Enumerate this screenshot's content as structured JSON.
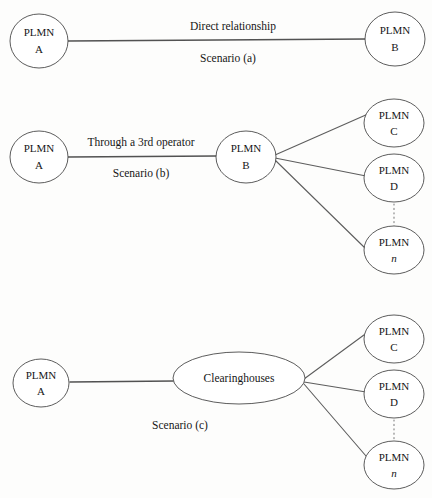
{
  "figure": {
    "background_color": "#fdfdfc",
    "stroke_color": "#5d5d5d",
    "node_fill": "#ffffff",
    "text_color": "#161616"
  },
  "scenarios": [
    {
      "id": "a",
      "caption": "Scenario (a)",
      "edge_caption": "Direct relationship",
      "nodes": [
        {
          "id": "a-plmn-a",
          "top": "PLMN",
          "bottom": "A",
          "shape": "circle",
          "italic_bottom": false
        },
        {
          "id": "a-plmn-b",
          "top": "PLMN",
          "bottom": "B",
          "shape": "circle",
          "italic_bottom": false
        }
      ]
    },
    {
      "id": "b",
      "caption": "Scenario (b)",
      "edge_caption": "Through a 3rd operator",
      "nodes": [
        {
          "id": "b-plmn-a",
          "top": "PLMN",
          "bottom": "A",
          "shape": "circle",
          "italic_bottom": false
        },
        {
          "id": "b-plmn-b",
          "top": "PLMN",
          "bottom": "B",
          "shape": "circle",
          "italic_bottom": false
        },
        {
          "id": "b-plmn-c",
          "top": "PLMN",
          "bottom": "C",
          "shape": "circle",
          "italic_bottom": false
        },
        {
          "id": "b-plmn-d",
          "top": "PLMN",
          "bottom": "D",
          "shape": "circle",
          "italic_bottom": false
        },
        {
          "id": "b-plmn-n",
          "top": "PLMN",
          "bottom": "n",
          "shape": "circle",
          "italic_bottom": true
        }
      ]
    },
    {
      "id": "c",
      "caption": "Scenario (c)",
      "edge_caption": "",
      "hub_label": "Clearinghouses",
      "nodes": [
        {
          "id": "c-plmn-a",
          "top": "PLMN",
          "bottom": "A",
          "shape": "circle",
          "italic_bottom": false
        },
        {
          "id": "c-hub",
          "top": "Clearinghouses",
          "bottom": "",
          "shape": "ellipse",
          "italic_bottom": false
        },
        {
          "id": "c-plmn-c",
          "top": "PLMN",
          "bottom": "C",
          "shape": "circle",
          "italic_bottom": false
        },
        {
          "id": "c-plmn-d",
          "top": "PLMN",
          "bottom": "D",
          "shape": "circle",
          "italic_bottom": false
        },
        {
          "id": "c-plmn-n",
          "top": "PLMN",
          "bottom": "n",
          "shape": "circle",
          "italic_bottom": true
        }
      ]
    }
  ],
  "labels": {
    "plmn": "PLMN",
    "a": "A",
    "b": "B",
    "c": "C",
    "d": "D",
    "n": "n",
    "clearinghouses": "Clearinghouses",
    "direct_relationship": "Direct relationship",
    "through_3rd_operator": "Through a 3rd operator",
    "scenario_a": "Scenario (a)",
    "scenario_b": "Scenario (b)",
    "scenario_c": "Scenario (c)"
  }
}
